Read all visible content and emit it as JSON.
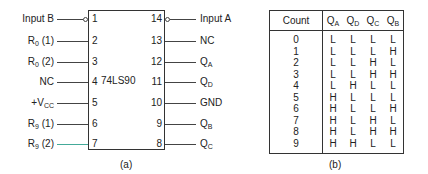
{
  "chip": {
    "name": "74LS90",
    "left_pins": [
      {
        "num": "1",
        "label": "Input B",
        "sub": "",
        "suffix": "",
        "bubble": true
      },
      {
        "num": "2",
        "label": "R",
        "sub": "0",
        "suffix": " (1)",
        "bubble": false
      },
      {
        "num": "3",
        "label": "R",
        "sub": "0",
        "suffix": " (2)",
        "bubble": false
      },
      {
        "num": "4",
        "label": "NC",
        "sub": "",
        "suffix": "",
        "bubble": false
      },
      {
        "num": "5",
        "label": "+V",
        "sub": "CC",
        "suffix": "",
        "bubble": false
      },
      {
        "num": "6",
        "label": "R",
        "sub": "9",
        "suffix": " (1)",
        "bubble": false
      },
      {
        "num": "7",
        "label": "R",
        "sub": "9",
        "suffix": " (2)",
        "bubble": false
      }
    ],
    "right_pins": [
      {
        "num": "14",
        "label": "Input A",
        "sub": "",
        "bubble": true
      },
      {
        "num": "13",
        "label": "NC",
        "sub": "",
        "bubble": false
      },
      {
        "num": "12",
        "label": "Q",
        "sub": "A",
        "bubble": false
      },
      {
        "num": "11",
        "label": "Q",
        "sub": "D",
        "bubble": false
      },
      {
        "num": "10",
        "label": "GND",
        "sub": "",
        "bubble": false
      },
      {
        "num": "9",
        "label": "Q",
        "sub": "B",
        "bubble": false
      },
      {
        "num": "8",
        "label": "Q",
        "sub": "C",
        "bubble": false
      }
    ],
    "caption": "(a)"
  },
  "truth_table": {
    "headers": [
      {
        "label": "Count",
        "sub": ""
      },
      {
        "label": "Q",
        "sub": "A"
      },
      {
        "label": "Q",
        "sub": "D"
      },
      {
        "label": "Q",
        "sub": "C"
      },
      {
        "label": "Q",
        "sub": "B"
      }
    ],
    "rows": [
      [
        "0",
        "L",
        "L",
        "L",
        "L"
      ],
      [
        "1",
        "L",
        "L",
        "L",
        "H"
      ],
      [
        "2",
        "L",
        "L",
        "H",
        "L"
      ],
      [
        "3",
        "L",
        "L",
        "H",
        "H"
      ],
      [
        "4",
        "L",
        "H",
        "L",
        "L"
      ],
      [
        "5",
        "H",
        "L",
        "L",
        "L"
      ],
      [
        "6",
        "H",
        "L",
        "L",
        "H"
      ],
      [
        "7",
        "H",
        "L",
        "H",
        "L"
      ],
      [
        "8",
        "H",
        "L",
        "H",
        "H"
      ],
      [
        "9",
        "H",
        "H",
        "L",
        "L"
      ]
    ],
    "caption": "(b)"
  }
}
